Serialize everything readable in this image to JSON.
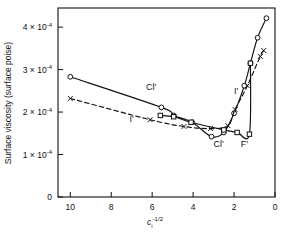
{
  "figure": {
    "background_color": "#ffffff",
    "line_color": "#111111",
    "marker_face_color": "#ffffff"
  },
  "chart_data": {
    "type": "line",
    "title": "",
    "xlabel": "c_i^-1/2",
    "xlabel_base": "c",
    "xlabel_sub": "i",
    "xlabel_sup": "-1/2",
    "ylabel": "Surface viscosity (surface poise)",
    "xlim": [
      10.6,
      0
    ],
    "ylim": [
      0,
      0.000445
    ],
    "x_inverted": true,
    "grid": false,
    "legend": "inline-labels",
    "xticks": [
      10,
      8,
      6,
      4,
      2,
      0
    ],
    "xticklabels": [
      "10",
      "8",
      "6",
      "4",
      "2",
      "0"
    ],
    "yticks": [
      0,
      0.0001,
      0.0002,
      0.0003,
      0.0004
    ],
    "yticklabels": [
      "0",
      "1 x 10",
      "2 x 10",
      "3 x 10",
      "4 x 10"
    ],
    "ytick_exponent": "-4",
    "ytick_mantissas": [
      "0",
      "1",
      "2",
      "3",
      "4"
    ],
    "series": [
      {
        "name": "Cl'",
        "label": "Cl'",
        "linestyle": "solid",
        "marker": "circle-open",
        "label_positions": [
          {
            "x": 6.05,
            "y": 0.000253
          },
          {
            "x": 2.75,
            "y": 0.000118
          }
        ],
        "points": [
          {
            "x": 10.0,
            "y": 0.000283
          },
          {
            "x": 5.55,
            "y": 0.000211
          },
          {
            "x": 4.95,
            "y": 0.000192
          },
          {
            "x": 4.05,
            "y": 0.000176
          },
          {
            "x": 3.1,
            "y": 0.000142
          },
          {
            "x": 2.5,
            "y": 0.000152
          },
          {
            "x": 2.0,
            "y": 0.000197
          },
          {
            "x": 1.5,
            "y": 0.000262
          },
          {
            "x": 1.2,
            "y": 0.000315
          },
          {
            "x": 0.85,
            "y": 0.000375
          },
          {
            "x": 0.42,
            "y": 0.000421
          }
        ]
      },
      {
        "name": "I'",
        "label": "I'",
        "linestyle": "dashed",
        "marker": "cross",
        "label_positions": [
          {
            "x": 7.0,
            "y": 0.000177
          },
          {
            "x": 1.9,
            "y": 0.000243
          }
        ],
        "points": [
          {
            "x": 10.0,
            "y": 0.000232
          },
          {
            "x": 6.1,
            "y": 0.000182
          },
          {
            "x": 4.45,
            "y": 0.000166
          },
          {
            "x": 3.15,
            "y": 0.000161
          },
          {
            "x": 2.3,
            "y": 0.000168
          },
          {
            "x": 1.95,
            "y": 0.000206
          },
          {
            "x": 1.35,
            "y": 0.000262
          },
          {
            "x": 0.72,
            "y": 0.000331
          },
          {
            "x": 0.55,
            "y": 0.000345
          }
        ]
      },
      {
        "name": "F'",
        "label": "F'",
        "linestyle": "solid",
        "marker": "square-open",
        "label_positions": [
          {
            "x": 1.5,
            "y": 0.000118
          }
        ],
        "points": [
          {
            "x": 5.6,
            "y": 0.000192
          },
          {
            "x": 4.95,
            "y": 0.000189
          },
          {
            "x": 4.1,
            "y": 0.000176
          },
          {
            "x": 2.5,
            "y": 0.000158
          },
          {
            "x": 1.85,
            "y": 0.000152
          },
          {
            "x": 1.25,
            "y": 0.000148
          },
          {
            "x": 1.2,
            "y": 0.000315
          }
        ]
      }
    ]
  }
}
